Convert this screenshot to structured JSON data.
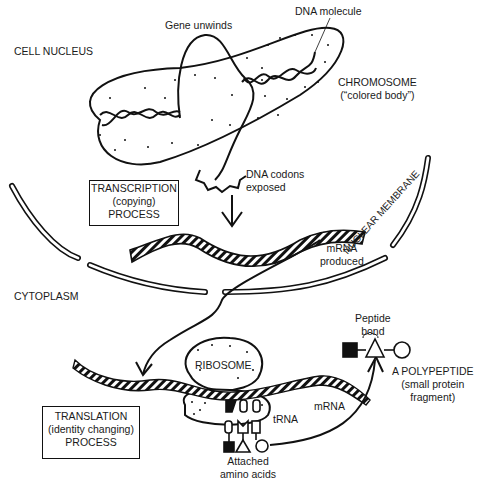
{
  "diagram": {
    "title_regions": {
      "cell_nucleus": "CELL NUCLEUS",
      "cytoplasm": "CYTOPLASM",
      "nuclear_membrane": "NUCLEAR MEMBRANE"
    },
    "labels": {
      "gene_unwinds": "Gene unwinds",
      "dna_molecule": "DNA molecule",
      "chromosome_line1": "CHROMOSOME",
      "chromosome_line2": "(“colored body”)",
      "dna_codons_line1": "DNA codons",
      "dna_codons_line2": "exposed",
      "mrna_produced_line1": "mRNA",
      "mrna_produced_line2": "produced",
      "ribosome": "RIBOSOME",
      "trna": "tRNA",
      "mrna": "mRNA",
      "attached_line1": "Attached",
      "attached_line2": "amino acids",
      "peptide_line1": "Peptide",
      "peptide_line2": "bond",
      "polypeptide_line1": "A POLYPEPTIDE",
      "polypeptide_line2": "(small protein",
      "polypeptide_line3": "fragment)"
    },
    "boxes": {
      "transcription": [
        "TRANSCRIPTION",
        "(copying)",
        "PROCESS"
      ],
      "translation": [
        "TRANSLATION",
        "(identity changing)",
        "PROCESS"
      ]
    }
  }
}
